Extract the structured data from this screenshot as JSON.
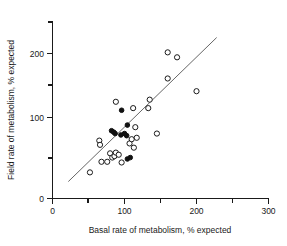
{
  "chart_data": {
    "type": "scatter",
    "title": "",
    "xlabel": "Basal rate of metabolism, % expected",
    "ylabel": "Field rate of metabolism, % expected",
    "xlim": [
      0,
      300
    ],
    "ylim": [
      0,
      250
    ],
    "x_major_ticks": [
      0,
      100,
      200,
      300
    ],
    "x_minor_ticks": [
      50,
      150,
      250
    ],
    "y_major_ticks": [
      0,
      100,
      200
    ],
    "y_minor_ticks": [
      50,
      150,
      250
    ],
    "x_tick_labels": [
      "0",
      "100",
      "200",
      "300"
    ],
    "y_tick_labels": [
      "0",
      "100",
      "200"
    ],
    "grid": false,
    "legend": null,
    "series": [
      {
        "name": "open-circles",
        "marker": "open-circle",
        "color": "#1a1a1a",
        "points": [
          [
            52,
            37
          ],
          [
            68,
            52
          ],
          [
            76,
            52
          ],
          [
            65,
            82
          ],
          [
            66,
            76
          ],
          [
            80,
            64
          ],
          [
            83,
            58
          ],
          [
            86,
            60
          ],
          [
            88,
            65
          ],
          [
            92,
            62
          ],
          [
            96,
            51
          ],
          [
            88,
            137
          ],
          [
            112,
            128
          ],
          [
            107,
            78
          ],
          [
            110,
            84
          ],
          [
            113,
            72
          ],
          [
            115,
            101
          ],
          [
            117,
            86
          ],
          [
            133,
            128
          ],
          [
            135,
            140
          ],
          [
            145,
            92
          ],
          [
            160,
            207
          ],
          [
            160,
            170
          ],
          [
            173,
            200
          ],
          [
            200,
            152
          ]
        ]
      },
      {
        "name": "filled-circles",
        "marker": "filled-circle",
        "color": "#111111",
        "points": [
          [
            82,
            96
          ],
          [
            85,
            94
          ],
          [
            87,
            92
          ],
          [
            95,
            90
          ],
          [
            96,
            125
          ],
          [
            100,
            92
          ],
          [
            103,
            89
          ],
          [
            104,
            104
          ],
          [
            104,
            56
          ],
          [
            108,
            58
          ]
        ]
      }
    ],
    "reference_line": {
      "name": "fit-line",
      "x_start": 22,
      "y_start": 24,
      "x_end": 228,
      "y_end": 228
    }
  }
}
